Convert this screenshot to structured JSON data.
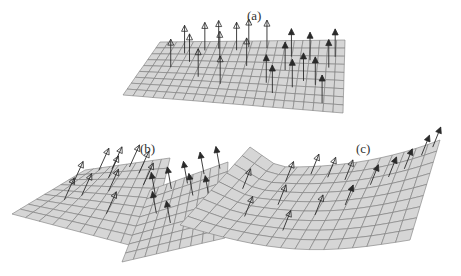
{
  "figure": {
    "panels": [
      {
        "id": "a",
        "label": "(a)",
        "shape": "flat plane with upright vectors"
      },
      {
        "id": "b",
        "label": "(b)",
        "shape": "two folded planes with tilted vectors"
      },
      {
        "id": "c",
        "label": "(c)",
        "shape": "curved saddle surface with normal vectors"
      }
    ],
    "colors": {
      "surface_fill": "#d6d6d6",
      "grid_line": "#7a7a7a",
      "vector": "#2a2a2a",
      "label": "#333333",
      "background": "#ffffff"
    }
  }
}
